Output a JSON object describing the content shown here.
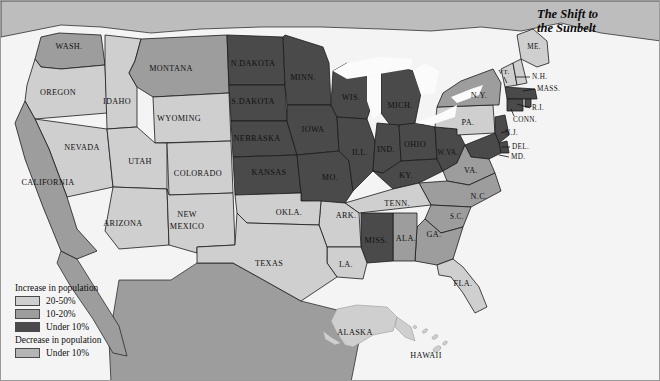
{
  "figure": {
    "title_line1": "The Shift to",
    "title_line2": "the Sunbelt",
    "background_color": "#e8e8e8",
    "border_color": "#9a9a9a"
  },
  "legend": {
    "increase_heading": "Increase in population",
    "decrease_heading": "Decrease in population",
    "items": [
      {
        "label": "20-50%",
        "color": "#cfcfcf",
        "group": "increase"
      },
      {
        "label": "10-20%",
        "color": "#9d9d9d",
        "group": "increase"
      },
      {
        "label": "Under 10%",
        "color": "#4a4a4a",
        "group": "increase"
      },
      {
        "label": "Under 10%",
        "color": "#b5b5b5",
        "group": "decrease"
      }
    ]
  },
  "palette": {
    "increase_20_50": "#cfcfcf",
    "increase_10_20": "#9d9d9d",
    "increase_under_10": "#4a4a4a",
    "decrease_under_10": "#b5b5b5",
    "canada": "#bdbdbd",
    "mexico": "#9d9d9d",
    "water": "#f6f6f6",
    "outline": "#1a1a1a"
  },
  "map_data": {
    "type": "choropleth",
    "region": "United States",
    "categories": [
      "20-50%",
      "10-20%",
      "Under 10%",
      "Decrease Under 10%"
    ],
    "states": [
      {
        "name": "WASH.",
        "label": "WASH.",
        "category": "10-20%",
        "x": 68,
        "y": 46
      },
      {
        "name": "OREGON",
        "label": "OREGON",
        "category": "20-50%",
        "x": 57,
        "y": 92
      },
      {
        "name": "IDAHO",
        "label": "IDAHO",
        "category": "20-50%",
        "x": 116,
        "y": 101
      },
      {
        "name": "MONTANA",
        "label": "MONTANA",
        "category": "10-20%",
        "x": 170,
        "y": 68
      },
      {
        "name": "WYOMING",
        "label": "WYOMING",
        "category": "20-50%",
        "x": 178,
        "y": 118
      },
      {
        "name": "NEVADA",
        "label": "NEVADA",
        "category": "20-50%",
        "x": 81,
        "y": 147
      },
      {
        "name": "UTAH",
        "label": "UTAH",
        "category": "20-50%",
        "x": 139,
        "y": 161
      },
      {
        "name": "CALIFORNIA",
        "label": "CALIFORNIA",
        "category": "10-20%",
        "x": 47,
        "y": 182
      },
      {
        "name": "ARIZONA",
        "label": "ARIZONA",
        "category": "20-50%",
        "x": 122,
        "y": 223
      },
      {
        "name": "COLORADO",
        "label": "COLORADO",
        "category": "20-50%",
        "x": 197,
        "y": 173
      },
      {
        "name": "NEW MEXICO",
        "label": "NEW",
        "label2": "MEXICO",
        "category": "20-50%",
        "x": 186,
        "y": 219
      },
      {
        "name": "N.DAKOTA",
        "label": "N.DAKOTA",
        "category": "Under 10%",
        "x": 252,
        "y": 63
      },
      {
        "name": "S.DAKOTA",
        "label": "S.DAKOTA",
        "category": "Under 10%",
        "x": 252,
        "y": 101
      },
      {
        "name": "NEBRASKA",
        "label": "NEBRASKA",
        "category": "Under 10%",
        "x": 256,
        "y": 138
      },
      {
        "name": "KANSAS",
        "label": "KANSAS",
        "category": "Under 10%",
        "x": 268,
        "y": 172
      },
      {
        "name": "MINN.",
        "label": "MINN.",
        "category": "Under 10%",
        "x": 302,
        "y": 77
      },
      {
        "name": "IOWA",
        "label": "IOWA",
        "category": "Under 10%",
        "x": 312,
        "y": 129
      },
      {
        "name": "MO.",
        "label": "MO.",
        "category": "Under 10%",
        "x": 329,
        "y": 177
      },
      {
        "name": "WIS.",
        "label": "WIS.",
        "category": "Under 10%",
        "x": 350,
        "y": 97
      },
      {
        "name": "ILL.",
        "label": "ILL.",
        "category": "Under 10%",
        "x": 359,
        "y": 152
      },
      {
        "name": "MICH.",
        "label": "MICH.",
        "category": "Under 10%",
        "x": 399,
        "y": 105
      },
      {
        "name": "IND.",
        "label": "IND.",
        "category": "Under 10%",
        "x": 385,
        "y": 149
      },
      {
        "name": "OHIO",
        "label": "OHIO",
        "category": "Under 10%",
        "x": 414,
        "y": 144
      },
      {
        "name": "KY.",
        "label": "KY.",
        "category": "Under 10%",
        "x": 405,
        "y": 175
      },
      {
        "name": "W.VA.",
        "label": "W.VA.",
        "category": "Under 10%",
        "x": 447,
        "y": 152
      },
      {
        "name": "PA.",
        "label": "PA.",
        "category": "20-50%",
        "x": 467,
        "y": 122
      },
      {
        "name": "N.Y.",
        "label": "N.Y.",
        "category": "10-20%",
        "x": 478,
        "y": 95
      },
      {
        "name": "ME.",
        "label": "ME.",
        "category": "20-50%",
        "x": 533,
        "y": 46
      },
      {
        "name": "VT.",
        "label": "VT.",
        "category": "20-50%",
        "x": 507,
        "y": 71
      },
      {
        "name": "N.H.",
        "label": "N.H.",
        "category": "20-50%",
        "x": 545,
        "y": 76
      },
      {
        "name": "MASS.",
        "label": "MASS.",
        "category": "Under 10%",
        "x": 551,
        "y": 88
      },
      {
        "name": "R.I.",
        "label": "R.I.",
        "category": "Under 10%",
        "x": 539,
        "y": 107
      },
      {
        "name": "CONN.",
        "label": "CONN.",
        "category": "Under 10%",
        "x": 533,
        "y": 118
      },
      {
        "name": "N.J.",
        "label": "N.J.",
        "category": "Under 10%",
        "x": 506,
        "y": 132
      },
      {
        "name": "DEL.",
        "label": "DEL.",
        "category": "Under 10%",
        "x": 520,
        "y": 146
      },
      {
        "name": "MD.",
        "label": "MD.",
        "category": "Under 10%",
        "x": 519,
        "y": 156
      },
      {
        "name": "VA.",
        "label": "VA.",
        "category": "10-20%",
        "x": 470,
        "y": 170
      },
      {
        "name": "N.C.",
        "label": "N.C.",
        "category": "10-20%",
        "x": 478,
        "y": 196
      },
      {
        "name": "TENN.",
        "label": "TENN.",
        "category": "10-20%",
        "x": 396,
        "y": 203
      },
      {
        "name": "S.C.",
        "label": "S.C.",
        "category": "10-20%",
        "x": 456,
        "y": 216
      },
      {
        "name": "GA.",
        "label": "GA.",
        "category": "10-20%",
        "x": 433,
        "y": 234
      },
      {
        "name": "ALA.",
        "label": "ALA.",
        "category": "10-20%",
        "x": 405,
        "y": 238
      },
      {
        "name": "MISS.",
        "label": "MISS.",
        "category": "Under 10%",
        "x": 375,
        "y": 240
      },
      {
        "name": "ARK.",
        "label": "ARK.",
        "category": "20-50%",
        "x": 345,
        "y": 215
      },
      {
        "name": "LA.",
        "label": "LA.",
        "category": "20-50%",
        "x": 345,
        "y": 264
      },
      {
        "name": "OKLA.",
        "label": "OKLA.",
        "category": "20-50%",
        "x": 288,
        "y": 212
      },
      {
        "name": "TEXAS",
        "label": "TEXAS",
        "category": "20-50%",
        "x": 268,
        "y": 263
      },
      {
        "name": "FLA.",
        "label": "FLA.",
        "category": "20-50%",
        "x": 462,
        "y": 283
      },
      {
        "name": "ALASKA",
        "label": "ALASKA",
        "category": "20-50%",
        "x": 354,
        "y": 332
      },
      {
        "name": "HAWAII",
        "label": "HAWAII",
        "category": "20-50%",
        "x": 425,
        "y": 355
      }
    ]
  }
}
